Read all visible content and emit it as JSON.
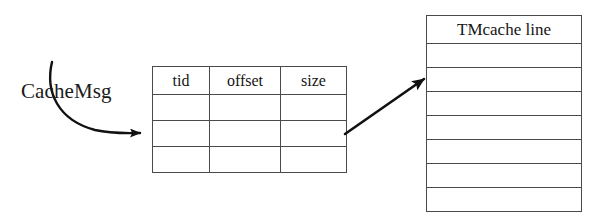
{
  "figure": {
    "name": "cachemsg-to-tmcache-line-diagram",
    "background_color": "#ffffff",
    "line_color": "#4a4a4a",
    "text_color": "#151515",
    "hatch_color": "#9a9a9a",
    "width": 611,
    "height": 220
  },
  "labels": {
    "cachemsg": "CacheMsg"
  },
  "cachemsg_table": {
    "name": "cachemsg-table",
    "columns": [
      "tid",
      "offset",
      "size"
    ],
    "rows": [
      {
        "index": 0,
        "hatched": false,
        "cells": [
          "",
          "",
          ""
        ]
      },
      {
        "index": 1,
        "hatched": true,
        "cells": [
          "",
          "",
          ""
        ]
      },
      {
        "index": 2,
        "hatched": false,
        "cells": [
          "",
          "",
          ""
        ]
      }
    ]
  },
  "tmcache": {
    "name": "tmcache-line-box",
    "title": "TMcache line",
    "rows": [
      {
        "index": 0,
        "hatched": false
      },
      {
        "index": 1,
        "hatched": true
      },
      {
        "index": 2,
        "hatched": true
      },
      {
        "index": 3,
        "hatched": true
      },
      {
        "index": 4,
        "hatched": false
      },
      {
        "index": 5,
        "hatched": false
      },
      {
        "index": 6,
        "hatched": false
      }
    ]
  },
  "arrows": [
    {
      "name": "cachemsg-curved-arrow",
      "from": "CacheMsg",
      "to": "cachemsg-table-hatched-row",
      "style": "curved"
    },
    {
      "name": "table-to-cacheline-arrow",
      "from": "cachemsg-table-hatched-row",
      "to": "tmcache-line-hatched-rows",
      "style": "straight"
    }
  ]
}
